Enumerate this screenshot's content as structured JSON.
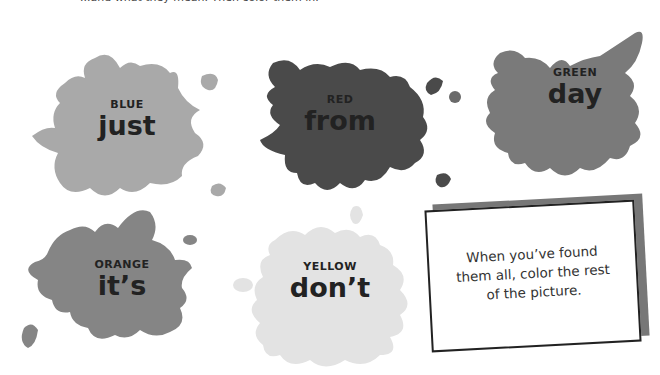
{
  "page": {
    "top_text": "...and what they mean. Then color them in."
  },
  "splats": [
    {
      "color_name": "BLUE",
      "word": "just",
      "fill": "#a9a9a9"
    },
    {
      "color_name": "RED",
      "word": "from",
      "fill": "#4a4a4a"
    },
    {
      "color_name": "GREEN",
      "word": "day",
      "fill": "#7a7a7a"
    },
    {
      "color_name": "ORANGE",
      "word": "it’s",
      "fill": "#858585"
    },
    {
      "color_name": "YELLOW",
      "word": "don’t",
      "fill": "#e3e3e3"
    }
  ],
  "card": {
    "text": "When you’ve found them all, color the rest of the picture."
  }
}
